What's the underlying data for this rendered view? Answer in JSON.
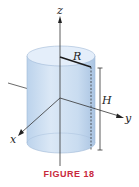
{
  "figure": {
    "caption": "FIGURE 18",
    "caption_color": "#c8283c",
    "labels": {
      "z_axis": "z",
      "y_axis": "y",
      "x_axis": "x",
      "radius": "R",
      "height": "H"
    },
    "colors": {
      "cylinder_fill": "#cfe0f2",
      "cylinder_top": "#e4eefa",
      "axis": "#333333",
      "radius_line": "#1a1a1a"
    }
  }
}
